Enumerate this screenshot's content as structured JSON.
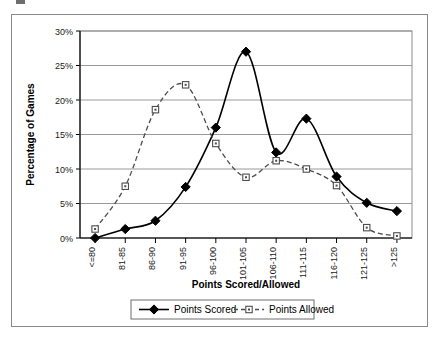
{
  "chart_data": {
    "type": "line",
    "title": "",
    "xlabel": "Points Scored/Allowed",
    "ylabel": "Percentage of Games",
    "categories": [
      "<=80",
      "81-85",
      "86-90",
      "91-95",
      "96-100",
      "101-105",
      "106-110",
      "111-115",
      "116-120",
      "121-125",
      ">125"
    ],
    "ytick_labels": [
      "0%",
      "5%",
      "10%",
      "15%",
      "20%",
      "25%",
      "30%"
    ],
    "ytick_values": [
      0,
      5,
      10,
      15,
      20,
      25,
      30
    ],
    "ylim": [
      0,
      30
    ],
    "grid": "horizontal",
    "legend_position": "bottom",
    "series": [
      {
        "name": "Points Scored",
        "marker": "filled-diamond",
        "line_style": "solid",
        "color": "#000000",
        "values": [
          0.0,
          1.3,
          2.5,
          7.4,
          16.0,
          27.0,
          12.4,
          17.3,
          8.9,
          5.1,
          3.9
        ]
      },
      {
        "name": "Points Allowed",
        "marker": "open-square",
        "line_style": "dashed",
        "color": "#4d4d4d",
        "values": [
          1.3,
          7.5,
          18.6,
          22.2,
          13.7,
          8.8,
          11.2,
          10.0,
          7.6,
          1.5,
          0.3
        ]
      }
    ]
  },
  "legend": {
    "items": [
      {
        "label": "Points Scored"
      },
      {
        "label": "Points Allowed"
      }
    ]
  }
}
